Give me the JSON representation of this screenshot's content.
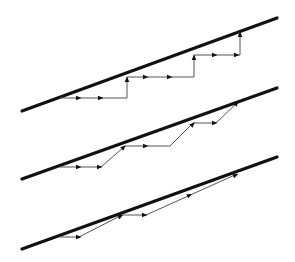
{
  "diagram": {
    "type": "stepwise-paths-toward-boundary",
    "colors": {
      "boundary": "#111111",
      "path": "#555555",
      "arrow": "#111111",
      "background": "#ffffff"
    },
    "panels": [
      {
        "name": "axis-aligned-staircase",
        "boundary": {
          "x1": 22,
          "y1": 111,
          "x2": 277,
          "y2": 18
        },
        "path": [
          [
            60,
            98
          ],
          [
            127,
            98
          ],
          [
            127,
            77
          ],
          [
            194,
            77
          ],
          [
            194,
            55
          ],
          [
            240,
            55
          ],
          [
            240,
            32
          ]
        ],
        "arrows": [
          {
            "x": 79,
            "y": 98,
            "dir": "right"
          },
          {
            "x": 101,
            "y": 98,
            "dir": "right"
          },
          {
            "x": 127,
            "y": 79,
            "dir": "up"
          },
          {
            "x": 146,
            "y": 77,
            "dir": "right"
          },
          {
            "x": 170,
            "y": 77,
            "dir": "right"
          },
          {
            "x": 194,
            "y": 57,
            "dir": "up"
          },
          {
            "x": 215,
            "y": 55,
            "dir": "right"
          },
          {
            "x": 237,
            "y": 55,
            "dir": "right"
          },
          {
            "x": 240,
            "y": 34,
            "dir": "up"
          }
        ]
      },
      {
        "name": "diagonal-staircase",
        "boundary": {
          "x1": 22,
          "y1": 179,
          "x2": 277,
          "y2": 88
        },
        "path": [
          [
            60,
            167
          ],
          [
            101,
            167
          ],
          [
            125,
            146
          ],
          [
            170,
            146
          ],
          [
            193,
            123
          ],
          [
            216,
            123
          ],
          [
            238,
            102
          ]
        ],
        "arrows": [
          {
            "x": 79,
            "y": 167,
            "dir": "right"
          },
          {
            "x": 100,
            "y": 167,
            "dir": "right"
          },
          {
            "x": 124,
            "y": 147,
            "dir": "up-right"
          },
          {
            "x": 146,
            "y": 146,
            "dir": "right"
          },
          {
            "x": 193,
            "y": 124,
            "dir": "up-right"
          },
          {
            "x": 215,
            "y": 123,
            "dir": "right"
          },
          {
            "x": 237,
            "y": 103,
            "dir": "up-right"
          }
        ]
      },
      {
        "name": "long-diagonal-steps",
        "boundary": {
          "x1": 22,
          "y1": 249,
          "x2": 277,
          "y2": 157
        },
        "path": [
          [
            60,
            237
          ],
          [
            79,
            237
          ],
          [
            122,
            215
          ],
          [
            146,
            215
          ],
          [
            237,
            174
          ]
        ],
        "arrows": [
          {
            "x": 79,
            "y": 237,
            "dir": "right"
          },
          {
            "x": 121,
            "y": 216,
            "dir": "up-right"
          },
          {
            "x": 145,
            "y": 215,
            "dir": "right"
          },
          {
            "x": 190,
            "y": 195,
            "dir": "up-right"
          },
          {
            "x": 236,
            "y": 175,
            "dir": "up-right"
          }
        ]
      }
    ]
  }
}
